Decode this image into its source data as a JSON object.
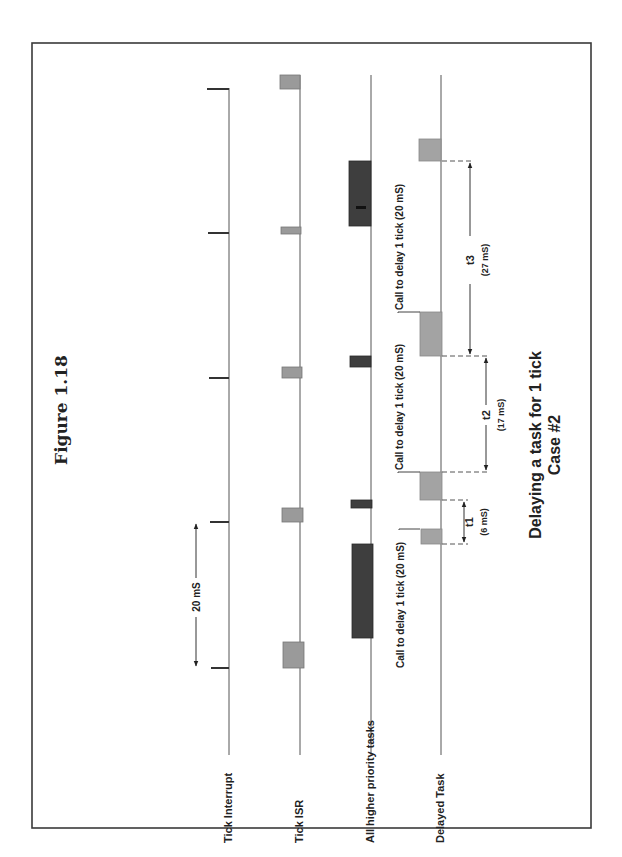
{
  "figure_label": "Figure 1.18",
  "title": {
    "line1": "Delaying a task for 1 tick",
    "line2": "Case #2"
  },
  "timelines": [
    {
      "id": "tick-interrupt",
      "label": "Tick Interrupt"
    },
    {
      "id": "tick-isr",
      "label": "Tick ISR"
    },
    {
      "id": "higher-priority",
      "label": "All higher priority tasks"
    },
    {
      "id": "delayed-task",
      "label": "Delayed Task"
    }
  ],
  "period_marker": {
    "label": "20 mS"
  },
  "calls": [
    {
      "label": "Call to delay 1 tick (20 mS)"
    },
    {
      "label": "Call to delay 1 tick (20 mS)"
    },
    {
      "label": "Call to delay 1 tick (20 mS)"
    }
  ],
  "intervals": [
    {
      "name": "t1",
      "value": "(6 mS)"
    },
    {
      "name": "t2",
      "value": "(17 mS)"
    },
    {
      "name": "t3",
      "value": "(27 mS)"
    }
  ],
  "colors": {
    "isr_box": "#9a9a9a",
    "higher_priority_box": "#3e3e3e",
    "delayed_task_box": "#a3a3a3",
    "frame": "#3a3a3a"
  }
}
